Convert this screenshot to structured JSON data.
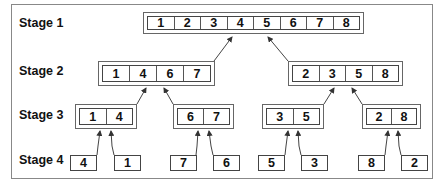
{
  "stages": [
    {
      "label": "Stage 1",
      "groups": [
        [
          "1",
          "2",
          "3",
          "4",
          "5",
          "6",
          "7",
          "8"
        ]
      ]
    },
    {
      "label": "Stage 2",
      "groups": [
        [
          "1",
          "4",
          "6",
          "7"
        ],
        [
          "2",
          "3",
          "5",
          "8"
        ]
      ]
    },
    {
      "label": "Stage 3",
      "groups": [
        [
          "1",
          "4"
        ],
        [
          "6",
          "7"
        ],
        [
          "3",
          "5"
        ],
        [
          "2",
          "8"
        ]
      ]
    },
    {
      "label": "Stage 4",
      "groups": [
        [
          "4"
        ],
        [
          "1"
        ],
        [
          "7"
        ],
        [
          "6"
        ],
        [
          "5"
        ],
        [
          "3"
        ],
        [
          "8"
        ],
        [
          "2"
        ]
      ]
    }
  ],
  "colors": {
    "line": "#444444",
    "frame": "#888888",
    "text": "#111111"
  }
}
